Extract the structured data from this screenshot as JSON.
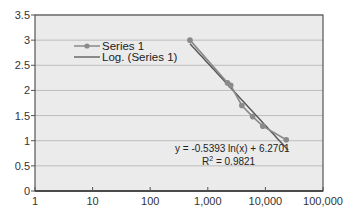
{
  "chart_data": {
    "type": "scatter",
    "title": "",
    "xlabel": "",
    "ylabel": "",
    "xscale": "log",
    "xlim": [
      1,
      100000
    ],
    "ylim": [
      0,
      3.5
    ],
    "grid": {
      "horizontal": true,
      "vertical": false
    },
    "x_ticks": [
      1,
      10,
      100,
      1000,
      10000,
      100000
    ],
    "x_tick_labels": [
      "1",
      "10",
      "100",
      "1,000",
      "10,000",
      "100,000"
    ],
    "y_ticks": [
      0,
      0.5,
      1,
      1.5,
      2,
      2.5,
      3,
      3.5
    ],
    "y_tick_labels": [
      "0",
      "0.5",
      "1",
      "1.5",
      "2",
      "2.5",
      "3",
      "3.5"
    ],
    "legend": {
      "position": "upper-left-inside",
      "entries": [
        "Series 1",
        "Log. (Series 1)"
      ]
    },
    "series": [
      {
        "name": "Series 1",
        "style": "line-with-markers",
        "points": [
          {
            "x": 490,
            "y": 3.0
          },
          {
            "x": 2200,
            "y": 2.15
          },
          {
            "x": 2500,
            "y": 2.1
          },
          {
            "x": 3900,
            "y": 1.7
          },
          {
            "x": 6000,
            "y": 1.48
          },
          {
            "x": 9000,
            "y": 1.29
          },
          {
            "x": 23000,
            "y": 1.02
          }
        ]
      },
      {
        "name": "Log. (Series 1)",
        "style": "trendline",
        "equation": {
          "a": -0.5393,
          "b": 6.2701,
          "form": "y = a ln(x) + b"
        },
        "x_range": [
          490,
          25000
        ]
      }
    ],
    "annotations": [
      {
        "text": "y = -0.5393 ln(x) + 6.2701",
        "near": "lower-right of plot"
      },
      {
        "text": "R² = 0.9821",
        "near": "lower-right of plot"
      }
    ]
  },
  "annotation": {
    "equation": "y = -0.5393 ln(x) + 6.2701",
    "r2_label": "R",
    "r2_sup": "2",
    "r2_value": " = 0.9821"
  },
  "colors": {
    "plot_bg": "#ebebeb",
    "gridline": "#bdbdbd",
    "axis": "#555555",
    "series": "#8a8a8a",
    "trendline": "#555555"
  }
}
